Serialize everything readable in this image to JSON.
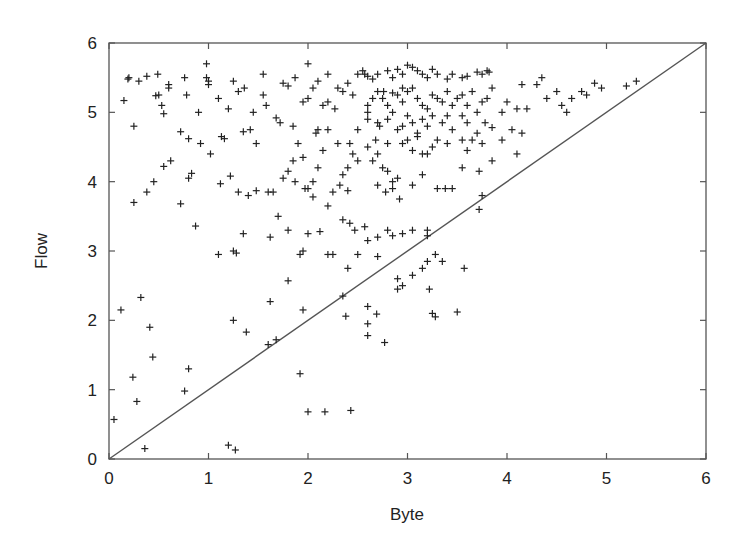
{
  "chart_data": {
    "type": "scatter",
    "title": "",
    "xlabel": "Byte",
    "ylabel": "Flow",
    "xlim": [
      0,
      6
    ],
    "ylim": [
      0,
      6
    ],
    "xticks": [
      "0",
      "1",
      "2",
      "3",
      "4",
      "5",
      "6"
    ],
    "yticks": [
      "0",
      "1",
      "2",
      "3",
      "4",
      "5",
      "6"
    ],
    "grid": false,
    "legend": null,
    "marker": "+",
    "reference_line": {
      "label": "y = x",
      "from": [
        0,
        0
      ],
      "to": [
        6,
        6
      ]
    },
    "series": [
      {
        "name": "points",
        "points": [
          [
            0.05,
            0.57
          ],
          [
            0.12,
            2.15
          ],
          [
            0.24,
            1.18
          ],
          [
            0.28,
            0.83
          ],
          [
            0.32,
            2.33
          ],
          [
            0.36,
            0.15
          ],
          [
            0.41,
            1.9
          ],
          [
            0.44,
            1.47
          ],
          [
            0.76,
            0.98
          ],
          [
            0.8,
            1.3
          ],
          [
            1.2,
            0.2
          ],
          [
            1.27,
            0.13
          ],
          [
            1.25,
            2.0
          ],
          [
            1.38,
            1.83
          ],
          [
            1.6,
            1.65
          ],
          [
            1.68,
            1.72
          ],
          [
            1.62,
            2.27
          ],
          [
            1.8,
            2.57
          ],
          [
            1.95,
            2.15
          ],
          [
            1.92,
            1.23
          ],
          [
            2.0,
            0.68
          ],
          [
            2.17,
            0.68
          ],
          [
            2.43,
            0.7
          ],
          [
            2.35,
            2.35
          ],
          [
            2.38,
            2.06
          ],
          [
            2.6,
            2.2
          ],
          [
            2.6,
            1.95
          ],
          [
            2.6,
            1.78
          ],
          [
            2.69,
            2.09
          ],
          [
            2.77,
            1.68
          ],
          [
            2.9,
            2.45
          ],
          [
            2.95,
            2.5
          ],
          [
            3.05,
            2.65
          ],
          [
            2.9,
            2.6
          ],
          [
            3.15,
            2.75
          ],
          [
            3.2,
            2.85
          ],
          [
            3.22,
            2.45
          ],
          [
            3.25,
            2.1
          ],
          [
            3.28,
            2.05
          ],
          [
            3.5,
            2.12
          ],
          [
            3.57,
            2.75
          ],
          [
            0.15,
            5.17
          ],
          [
            0.19,
            5.48
          ],
          [
            0.2,
            5.5
          ],
          [
            0.25,
            4.8
          ],
          [
            0.3,
            5.45
          ],
          [
            0.38,
            5.52
          ],
          [
            0.49,
            5.55
          ],
          [
            0.47,
            5.24
          ],
          [
            0.5,
            5.25
          ],
          [
            0.53,
            5.1
          ],
          [
            0.55,
            4.98
          ],
          [
            0.6,
            5.4
          ],
          [
            0.6,
            5.35
          ],
          [
            0.72,
            4.72
          ],
          [
            0.8,
            4.62
          ],
          [
            0.76,
            5.5
          ],
          [
            0.78,
            5.25
          ],
          [
            0.9,
            5.0
          ],
          [
            0.92,
            4.55
          ],
          [
            0.98,
            5.5
          ],
          [
            1.0,
            5.45
          ],
          [
            1.02,
            4.4
          ],
          [
            1.1,
            5.2
          ],
          [
            1.13,
            4.65
          ],
          [
            1.16,
            4.62
          ],
          [
            1.2,
            5.05
          ],
          [
            1.25,
            5.45
          ],
          [
            1.3,
            5.3
          ],
          [
            1.36,
            5.35
          ],
          [
            1.35,
            4.72
          ],
          [
            1.42,
            4.75
          ],
          [
            1.45,
            5.0
          ],
          [
            1.48,
            4.55
          ],
          [
            1.55,
            5.25
          ],
          [
            1.58,
            5.1
          ],
          [
            1.68,
            4.92
          ],
          [
            1.72,
            4.85
          ],
          [
            1.75,
            5.42
          ],
          [
            1.8,
            5.38
          ],
          [
            1.85,
            4.8
          ],
          [
            1.95,
            5.15
          ],
          [
            2.0,
            5.2
          ],
          [
            2.08,
            4.7
          ],
          [
            2.1,
            4.75
          ],
          [
            2.15,
            5.1
          ],
          [
            2.2,
            5.15
          ],
          [
            2.27,
            5.05
          ],
          [
            2.35,
            5.3
          ],
          [
            2.42,
            4.55
          ],
          [
            2.45,
            5.25
          ],
          [
            2.5,
            4.75
          ],
          [
            2.57,
            5.55
          ],
          [
            2.6,
            5.0
          ],
          [
            2.68,
            4.6
          ],
          [
            2.72,
            4.8
          ],
          [
            2.76,
            5.3
          ],
          [
            2.8,
            4.55
          ],
          [
            2.85,
            5.28
          ],
          [
            2.95,
            5.35
          ],
          [
            0.98,
            5.7
          ],
          [
            1.0,
            5.4
          ],
          [
            1.55,
            5.55
          ],
          [
            1.87,
            5.5
          ],
          [
            2.0,
            5.7
          ],
          [
            2.05,
            5.35
          ],
          [
            2.2,
            5.55
          ],
          [
            2.1,
            5.45
          ],
          [
            2.3,
            5.35
          ],
          [
            2.4,
            5.42
          ],
          [
            2.5,
            5.55
          ],
          [
            2.55,
            5.6
          ],
          [
            2.6,
            5.52
          ],
          [
            2.65,
            5.48
          ],
          [
            2.7,
            5.55
          ],
          [
            2.8,
            5.6
          ],
          [
            2.85,
            5.5
          ],
          [
            2.9,
            5.62
          ],
          [
            2.95,
            5.55
          ],
          [
            3.0,
            5.68
          ],
          [
            3.05,
            5.65
          ],
          [
            3.1,
            5.6
          ],
          [
            3.15,
            5.55
          ],
          [
            3.2,
            5.5
          ],
          [
            3.25,
            5.62
          ],
          [
            3.3,
            5.55
          ],
          [
            3.4,
            5.48
          ],
          [
            3.45,
            5.55
          ],
          [
            3.55,
            5.5
          ],
          [
            3.6,
            5.52
          ],
          [
            3.7,
            5.58
          ],
          [
            3.75,
            5.55
          ],
          [
            3.8,
            5.6
          ],
          [
            3.82,
            5.58
          ],
          [
            2.6,
            5.1
          ],
          [
            2.65,
            5.2
          ],
          [
            2.7,
            5.3
          ],
          [
            2.75,
            5.2
          ],
          [
            2.8,
            5.1
          ],
          [
            2.85,
            5.0
          ],
          [
            2.9,
            5.25
          ],
          [
            2.95,
            5.15
          ],
          [
            3.0,
            5.3
          ],
          [
            3.05,
            5.35
          ],
          [
            3.1,
            5.2
          ],
          [
            3.15,
            5.1
          ],
          [
            3.2,
            5.05
          ],
          [
            3.25,
            5.25
          ],
          [
            3.3,
            5.2
          ],
          [
            3.35,
            5.15
          ],
          [
            3.4,
            5.3
          ],
          [
            3.45,
            5.1
          ],
          [
            3.5,
            5.2
          ],
          [
            3.55,
            5.25
          ],
          [
            3.6,
            5.1
          ],
          [
            3.65,
            5.3
          ],
          [
            3.7,
            5.0
          ],
          [
            3.75,
            5.15
          ],
          [
            3.8,
            5.2
          ],
          [
            3.85,
            5.35
          ],
          [
            2.6,
            4.9
          ],
          [
            2.7,
            4.85
          ],
          [
            2.8,
            4.9
          ],
          [
            2.9,
            4.75
          ],
          [
            2.95,
            4.8
          ],
          [
            3.0,
            4.95
          ],
          [
            3.05,
            4.85
          ],
          [
            3.1,
            4.7
          ],
          [
            3.15,
            4.9
          ],
          [
            3.2,
            4.8
          ],
          [
            3.25,
            4.95
          ],
          [
            3.35,
            4.85
          ],
          [
            3.4,
            4.95
          ],
          [
            3.45,
            4.75
          ],
          [
            3.55,
            4.95
          ],
          [
            3.6,
            4.85
          ],
          [
            3.7,
            4.7
          ],
          [
            3.78,
            4.85
          ],
          [
            3.85,
            4.78
          ],
          [
            3.95,
            5.0
          ],
          [
            4.0,
            5.15
          ],
          [
            2.6,
            4.5
          ],
          [
            2.65,
            4.3
          ],
          [
            2.7,
            4.4
          ],
          [
            2.75,
            4.2
          ],
          [
            2.8,
            4.15
          ],
          [
            2.85,
            4.0
          ],
          [
            2.9,
            4.05
          ],
          [
            2.95,
            4.55
          ],
          [
            3.0,
            4.6
          ],
          [
            3.05,
            4.45
          ],
          [
            3.1,
            4.65
          ],
          [
            3.15,
            4.4
          ],
          [
            3.2,
            4.4
          ],
          [
            3.25,
            4.5
          ],
          [
            3.3,
            4.6
          ],
          [
            3.4,
            4.55
          ],
          [
            3.55,
            4.6
          ],
          [
            3.6,
            4.45
          ],
          [
            3.65,
            4.6
          ],
          [
            3.75,
            4.55
          ],
          [
            3.85,
            4.3
          ],
          [
            2.5,
            4.3
          ],
          [
            2.4,
            4.2
          ],
          [
            2.35,
            4.1
          ],
          [
            2.45,
            4.4
          ],
          [
            2.3,
            4.55
          ],
          [
            2.2,
            4.75
          ],
          [
            2.15,
            4.45
          ],
          [
            2.1,
            4.2
          ],
          [
            2.05,
            4.0
          ],
          [
            2.0,
            3.9
          ],
          [
            1.95,
            4.35
          ],
          [
            1.9,
            4.55
          ],
          [
            1.85,
            4.3
          ],
          [
            1.8,
            4.15
          ],
          [
            1.75,
            4.05
          ],
          [
            2.7,
            3.95
          ],
          [
            2.78,
            3.85
          ],
          [
            2.85,
            3.9
          ],
          [
            2.92,
            3.75
          ],
          [
            3.05,
            3.95
          ],
          [
            3.15,
            4.1
          ],
          [
            3.3,
            3.9
          ],
          [
            3.38,
            3.9
          ],
          [
            3.45,
            3.9
          ],
          [
            3.55,
            4.2
          ],
          [
            3.72,
            3.6
          ],
          [
            3.75,
            3.8
          ],
          [
            3.72,
            4.15
          ],
          [
            0.25,
            3.7
          ],
          [
            0.38,
            3.85
          ],
          [
            0.45,
            4.0
          ],
          [
            0.55,
            4.22
          ],
          [
            0.62,
            4.3
          ],
          [
            0.72,
            3.68
          ],
          [
            0.8,
            4.05
          ],
          [
            0.83,
            4.12
          ],
          [
            0.87,
            3.36
          ],
          [
            1.12,
            3.97
          ],
          [
            1.22,
            4.08
          ],
          [
            1.3,
            3.85
          ],
          [
            1.4,
            3.8
          ],
          [
            1.48,
            3.87
          ],
          [
            1.6,
            3.85
          ],
          [
            1.65,
            3.85
          ],
          [
            1.7,
            3.5
          ],
          [
            1.87,
            4.0
          ],
          [
            1.97,
            3.9
          ],
          [
            2.05,
            3.78
          ],
          [
            2.2,
            3.65
          ],
          [
            2.25,
            3.85
          ],
          [
            2.32,
            3.95
          ],
          [
            2.4,
            3.87
          ],
          [
            1.35,
            3.25
          ],
          [
            1.1,
            2.95
          ],
          [
            1.25,
            3.0
          ],
          [
            1.28,
            2.97
          ],
          [
            1.62,
            3.2
          ],
          [
            1.8,
            3.3
          ],
          [
            1.95,
            3.0
          ],
          [
            1.92,
            2.95
          ],
          [
            2.0,
            3.25
          ],
          [
            2.12,
            3.28
          ],
          [
            2.25,
            2.95
          ],
          [
            2.35,
            3.45
          ],
          [
            2.42,
            3.4
          ],
          [
            2.47,
            3.3
          ],
          [
            2.57,
            3.35
          ],
          [
            2.6,
            3.15
          ],
          [
            2.7,
            2.92
          ],
          [
            2.8,
            3.3
          ],
          [
            2.85,
            3.22
          ],
          [
            2.95,
            3.25
          ],
          [
            3.05,
            3.3
          ],
          [
            3.2,
            3.22
          ],
          [
            3.28,
            2.95
          ],
          [
            3.35,
            2.85
          ],
          [
            3.2,
            3.3
          ],
          [
            2.7,
            3.2
          ],
          [
            2.5,
            2.95
          ],
          [
            2.4,
            2.75
          ],
          [
            2.2,
            2.95
          ],
          [
            4.1,
            5.05
          ],
          [
            4.15,
            5.4
          ],
          [
            4.3,
            5.4
          ],
          [
            4.35,
            5.5
          ],
          [
            4.4,
            5.2
          ],
          [
            4.5,
            5.3
          ],
          [
            4.6,
            5.0
          ],
          [
            4.65,
            5.2
          ],
          [
            4.75,
            5.3
          ],
          [
            4.8,
            5.25
          ],
          [
            4.88,
            5.42
          ],
          [
            4.95,
            5.35
          ],
          [
            5.2,
            5.38
          ],
          [
            5.3,
            5.45
          ],
          [
            4.2,
            5.05
          ],
          [
            4.55,
            5.1
          ],
          [
            4.05,
            4.75
          ],
          [
            4.15,
            4.7
          ],
          [
            3.95,
            4.6
          ],
          [
            4.1,
            4.4
          ]
        ]
      }
    ]
  }
}
